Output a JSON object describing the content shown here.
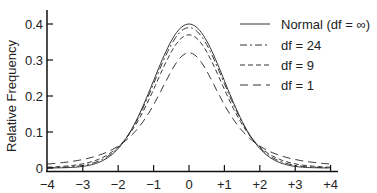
{
  "chart_data": {
    "type": "line",
    "title": "",
    "xlabel": "",
    "ylabel": "Relative Frequency",
    "xlim": [
      -4,
      4
    ],
    "ylim": [
      0,
      0.44
    ],
    "grid": false,
    "legend_position": "upper right",
    "x_ticks": [
      "−4",
      "−3",
      "−2",
      "−1",
      "0",
      "+1",
      "+2",
      "+3",
      "+4"
    ],
    "y_ticks": [
      "0",
      "0.1",
      "0.2",
      "0.3",
      "0.4"
    ],
    "series": [
      {
        "name": "Normal (df = ∞)",
        "style": "solid",
        "df": null,
        "peak": 0.4
      },
      {
        "name": "df = 24",
        "style": "dash-dot",
        "df": 24,
        "peak": 0.39
      },
      {
        "name": "df = 9",
        "style": "dashed-short",
        "df": 9,
        "peak": 0.37
      },
      {
        "name": "df = 1",
        "style": "dashed-long",
        "df": 1,
        "peak": 0.32
      }
    ]
  },
  "axis": {
    "ylabel": "Relative Frequency",
    "x_ticks": [
      "−4",
      "−3",
      "−2",
      "−1",
      "0",
      "+1",
      "+2",
      "+3",
      "+4"
    ],
    "y_ticks": [
      "0",
      "0.1",
      "0.2",
      "0.3",
      "0.4"
    ]
  },
  "legend": [
    {
      "label": "Normal (df = ∞)"
    },
    {
      "label": "df = 24"
    },
    {
      "label": "df = 9"
    },
    {
      "label": "df = 1"
    }
  ]
}
